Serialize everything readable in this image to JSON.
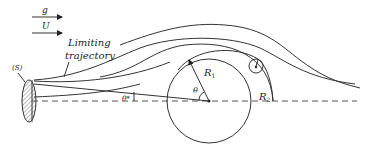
{
  "diagram": {
    "legend": {
      "g_label": "g",
      "U_label": "U"
    },
    "labels": {
      "limiting_line1": "Limiting",
      "limiting_line2": "trajectory",
      "source": "(S)",
      "R1": "R",
      "R1_sub": "1",
      "R2": "R",
      "R2_sub": "2",
      "theta": "θ",
      "theta_star": "θ*"
    },
    "colors": {
      "stroke": "#333333",
      "hatch": "#555555",
      "background": "#ffffff"
    }
  }
}
